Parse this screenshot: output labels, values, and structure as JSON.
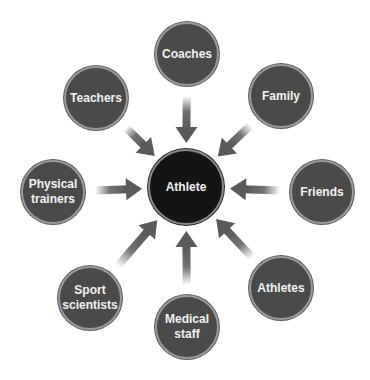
{
  "diagram": {
    "center": {
      "label": "Athlete",
      "x": 186,
      "y": 187,
      "r": 38
    },
    "nodes": [
      {
        "id": "coaches",
        "label": "Coaches",
        "x": 187,
        "y": 54
      },
      {
        "id": "family",
        "label": "Family",
        "x": 281,
        "y": 96
      },
      {
        "id": "friends",
        "label": "Friends",
        "x": 322,
        "y": 192
      },
      {
        "id": "athletes",
        "label": "Athletes",
        "x": 281,
        "y": 288
      },
      {
        "id": "medical-staff",
        "label": "Medical staff",
        "x": 187,
        "y": 327
      },
      {
        "id": "sport-scientists",
        "label": "Sport scientists",
        "x": 90,
        "y": 298
      },
      {
        "id": "physical-trainers",
        "label": "Physical trainers",
        "x": 53,
        "y": 192
      },
      {
        "id": "teachers",
        "label": "Teachers",
        "x": 96,
        "y": 98
      }
    ],
    "node_radius": 32,
    "colors": {
      "outer_fill": "#4a4a4a",
      "center_fill": "#141414",
      "arrow": "#5a5a5a",
      "text": "#f2f2f2"
    }
  }
}
